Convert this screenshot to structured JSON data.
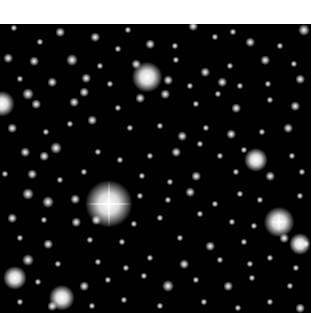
{
  "image": {
    "subject": "star field",
    "background": "#000000",
    "margin_color": "#ffffff",
    "field": {
      "x": 0,
      "y": 24,
      "width": 311,
      "height": 289
    }
  },
  "bright_stars": [
    {
      "x": 109,
      "y": 180,
      "size": 22,
      "spikes": 46
    },
    {
      "x": 147,
      "y": 53,
      "size": 14,
      "spikes": 0
    },
    {
      "x": 279,
      "y": 198,
      "size": 14,
      "spikes": 18
    },
    {
      "x": 62,
      "y": 274,
      "size": 12,
      "spikes": 0
    },
    {
      "x": 256,
      "y": 136,
      "size": 11,
      "spikes": 0
    },
    {
      "x": 300,
      "y": 220,
      "size": 10,
      "spikes": 0
    },
    {
      "x": 2,
      "y": 80,
      "size": 12,
      "spikes": 0
    },
    {
      "x": 15,
      "y": 254,
      "size": 11,
      "spikes": 0
    }
  ],
  "stars": [
    [
      14,
      4,
      3
    ],
    [
      60,
      8,
      4
    ],
    [
      128,
      6,
      3
    ],
    [
      193,
      2,
      4
    ],
    [
      233,
      8,
      3
    ],
    [
      304,
      6,
      5
    ],
    [
      40,
      18,
      3
    ],
    [
      95,
      13,
      4
    ],
    [
      118,
      25,
      3
    ],
    [
      150,
      20,
      4
    ],
    [
      175,
      22,
      3
    ],
    [
      215,
      13,
      3
    ],
    [
      250,
      18,
      4
    ],
    [
      280,
      22,
      3
    ],
    [
      8,
      34,
      4
    ],
    [
      34,
      37,
      4
    ],
    [
      72,
      36,
      5
    ],
    [
      100,
      42,
      3
    ],
    [
      136,
      40,
      4
    ],
    [
      176,
      36,
      3
    ],
    [
      205,
      48,
      4
    ],
    [
      230,
      42,
      3
    ],
    [
      265,
      36,
      4
    ],
    [
      294,
      40,
      3
    ],
    [
      20,
      55,
      3
    ],
    [
      52,
      58,
      4
    ],
    [
      86,
      54,
      4
    ],
    [
      110,
      60,
      3
    ],
    [
      168,
      56,
      4
    ],
    [
      190,
      62,
      3
    ],
    [
      222,
      58,
      4
    ],
    [
      240,
      62,
      3
    ],
    [
      268,
      60,
      3
    ],
    [
      300,
      55,
      4
    ],
    [
      28,
      70,
      5
    ],
    [
      36,
      80,
      4
    ],
    [
      74,
      78,
      4
    ],
    [
      84,
      68,
      4
    ],
    [
      118,
      84,
      3
    ],
    [
      140,
      74,
      4
    ],
    [
      165,
      70,
      4
    ],
    [
      196,
      80,
      3
    ],
    [
      218,
      70,
      3
    ],
    [
      236,
      84,
      4
    ],
    [
      270,
      76,
      3
    ],
    [
      295,
      82,
      4
    ],
    [
      12,
      104,
      4
    ],
    [
      46,
      108,
      3
    ],
    [
      70,
      100,
      3
    ],
    [
      92,
      96,
      4
    ],
    [
      130,
      104,
      3
    ],
    [
      160,
      102,
      3
    ],
    [
      182,
      112,
      4
    ],
    [
      206,
      104,
      3
    ],
    [
      231,
      110,
      4
    ],
    [
      262,
      108,
      3
    ],
    [
      288,
      104,
      4
    ],
    [
      25,
      128,
      4
    ],
    [
      56,
      124,
      5
    ],
    [
      44,
      132,
      4
    ],
    [
      98,
      128,
      3
    ],
    [
      120,
      136,
      3
    ],
    [
      150,
      132,
      3
    ],
    [
      176,
      128,
      4
    ],
    [
      200,
      120,
      3
    ],
    [
      220,
      132,
      3
    ],
    [
      244,
      126,
      3
    ],
    [
      292,
      132,
      3
    ],
    [
      5,
      150,
      3
    ],
    [
      32,
      150,
      4
    ],
    [
      60,
      156,
      3
    ],
    [
      84,
      148,
      3
    ],
    [
      142,
      152,
      3
    ],
    [
      170,
      158,
      3
    ],
    [
      196,
      152,
      4
    ],
    [
      236,
      148,
      3
    ],
    [
      270,
      152,
      4
    ],
    [
      302,
      148,
      3
    ],
    [
      28,
      170,
      5
    ],
    [
      48,
      178,
      5
    ],
    [
      75,
      175,
      4
    ],
    [
      140,
      172,
      3
    ],
    [
      168,
      176,
      3
    ],
    [
      190,
      168,
      4
    ],
    [
      215,
      180,
      3
    ],
    [
      240,
      170,
      3
    ],
    [
      260,
      176,
      3
    ],
    [
      300,
      172,
      3
    ],
    [
      12,
      194,
      4
    ],
    [
      44,
      196,
      3
    ],
    [
      76,
      198,
      4
    ],
    [
      96,
      196,
      4
    ],
    [
      134,
      200,
      3
    ],
    [
      160,
      194,
      3
    ],
    [
      200,
      190,
      3
    ],
    [
      232,
      198,
      3
    ],
    [
      254,
      202,
      3
    ],
    [
      20,
      214,
      3
    ],
    [
      48,
      220,
      4
    ],
    [
      90,
      216,
      3
    ],
    [
      122,
      218,
      3
    ],
    [
      180,
      214,
      3
    ],
    [
      210,
      222,
      4
    ],
    [
      244,
      218,
      3
    ],
    [
      284,
      214,
      4
    ],
    [
      306,
      220,
      3
    ],
    [
      28,
      236,
      5
    ],
    [
      58,
      240,
      3
    ],
    [
      98,
      238,
      3
    ],
    [
      126,
      244,
      3
    ],
    [
      150,
      234,
      3
    ],
    [
      184,
      240,
      4
    ],
    [
      220,
      236,
      3
    ],
    [
      250,
      240,
      3
    ],
    [
      270,
      234,
      3
    ],
    [
      296,
      244,
      3
    ],
    [
      38,
      258,
      3
    ],
    [
      84,
      262,
      4
    ],
    [
      108,
      256,
      3
    ],
    [
      144,
      252,
      3
    ],
    [
      168,
      262,
      5
    ],
    [
      196,
      256,
      3
    ],
    [
      228,
      262,
      4
    ],
    [
      252,
      254,
      3
    ],
    [
      290,
      262,
      3
    ],
    [
      20,
      278,
      3
    ],
    [
      52,
      282,
      4
    ],
    [
      92,
      282,
      3
    ],
    [
      124,
      276,
      3
    ],
    [
      160,
      282,
      3
    ],
    [
      204,
      278,
      3
    ],
    [
      238,
      284,
      3
    ],
    [
      270,
      278,
      3
    ],
    [
      300,
      284,
      4
    ]
  ]
}
